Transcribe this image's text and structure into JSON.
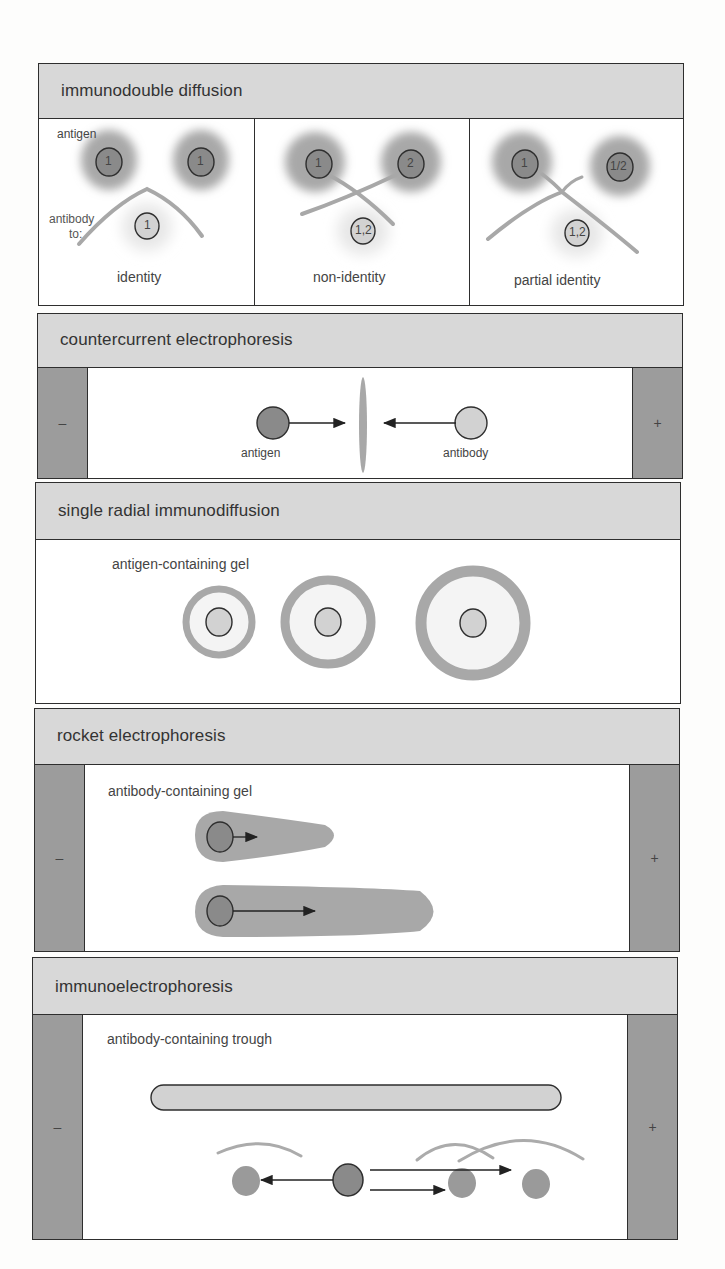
{
  "panels": {
    "double_diffusion": {
      "title": "immunodouble diffusion",
      "label_antigen": "antigen",
      "label_antibody_line1": "antibody",
      "label_antibody_line2": "to:",
      "cells": [
        {
          "caption": "identity",
          "well_left": "1",
          "well_right": "1",
          "well_bottom": "1",
          "pattern": "fused arc"
        },
        {
          "caption": "non-identity",
          "well_left": "1",
          "well_right": "2",
          "well_bottom": "1,2",
          "pattern": "crossed lines"
        },
        {
          "caption": "partial identity",
          "well_left": "1",
          "well_right": "1/2",
          "well_bottom": "1,2",
          "pattern": "spur"
        }
      ]
    },
    "countercurrent": {
      "title": "countercurrent electrophoresis",
      "electrode_left": "–",
      "electrode_right": "+",
      "label_antigen": "antigen",
      "label_antibody": "antibody"
    },
    "radial": {
      "title": "single radial immunodiffusion",
      "gel_label": "antigen-containing gel",
      "rings": [
        "small",
        "medium",
        "large"
      ]
    },
    "rocket": {
      "title": "rocket electrophoresis",
      "gel_label": "antibody-containing gel",
      "electrode_left": "–",
      "electrode_right": "+",
      "rockets": [
        "short",
        "long"
      ]
    },
    "immunoelectro": {
      "title": "immunoelectrophoresis",
      "trough_label": "antibody-containing trough",
      "electrode_left": "–",
      "electrode_right": "+"
    }
  },
  "colors": {
    "header_fill": "#d8d8d8",
    "electrode_fill": "#9c9c9c",
    "antigen_dark": "#8a8a8a",
    "antibody_light": "#d0d0d0",
    "precipitin": "#ababab",
    "outline": "#2e2e2e"
  }
}
